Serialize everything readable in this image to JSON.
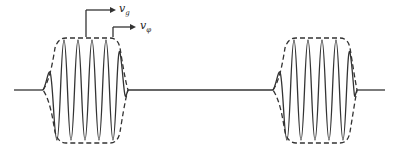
{
  "labels": {
    "group_velocity": "v",
    "group_sub": "g",
    "phase_velocity": "v",
    "phase_sub": "φ"
  },
  "packets": [
    {
      "name": "packet-1",
      "x_start": 43,
      "x_end": 128
    },
    {
      "name": "packet-2",
      "x_start": 273,
      "x_end": 357
    }
  ],
  "colors": {
    "stroke": "#333333"
  }
}
